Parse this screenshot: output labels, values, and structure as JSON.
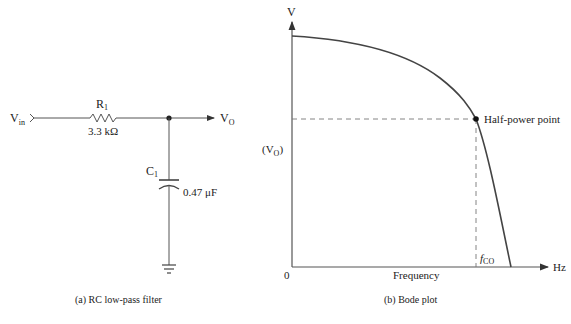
{
  "circuit": {
    "input_label": "V",
    "input_sub": "in",
    "resistor_name": "R",
    "resistor_sub": "1",
    "resistor_value": "3.3 kΩ",
    "capacitor_name": "C",
    "capacitor_sub": "1",
    "capacitor_value": "0.47 μF",
    "output_label": "V",
    "output_sub": "O",
    "caption": "(a) RC low-pass filter"
  },
  "bode": {
    "y_axis_label": "V",
    "y_marker_open": "(V",
    "y_marker_sub": "O",
    "y_marker_close": ")",
    "origin_label": "0",
    "x_axis_label": "Frequency",
    "x_unit": "Hz",
    "point_label": "Half-power point",
    "cutoff_label": "f",
    "cutoff_sub": "CO",
    "caption": "(b) Bode plot"
  }
}
